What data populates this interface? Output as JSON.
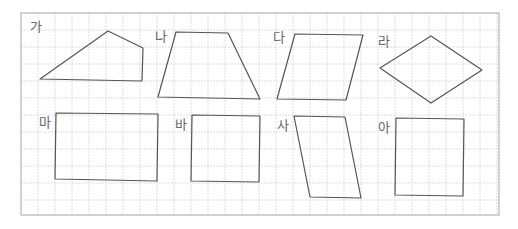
{
  "figure": {
    "grid": {
      "left": 21,
      "top": 13,
      "right": 499,
      "bottom": 215,
      "spacing": 17,
      "line_color": "#d4d4d4",
      "border_color": "#b5b5b5"
    },
    "stroke_color": "#555555",
    "shapes": [
      {
        "label": "가",
        "label_pos": [
          30,
          31
        ],
        "points": [
          [
            40,
            79
          ],
          [
            108,
            31
          ],
          [
            143,
            48
          ],
          [
            142,
            81
          ]
        ]
      },
      {
        "label": "나",
        "label_pos": [
          155,
          41
        ],
        "points": [
          [
            176,
            32
          ],
          [
            228,
            33
          ],
          [
            260,
            99
          ],
          [
            158,
            97
          ]
        ]
      },
      {
        "label": "다",
        "label_pos": [
          273,
          42
        ],
        "points": [
          [
            295,
            34
          ],
          [
            363,
            35
          ],
          [
            346,
            100
          ],
          [
            277,
            99
          ]
        ]
      },
      {
        "label": "라",
        "label_pos": [
          378,
          46
        ],
        "points": [
          [
            431,
            36
          ],
          [
            482,
            70
          ],
          [
            431,
            103
          ],
          [
            380,
            68
          ]
        ]
      },
      {
        "label": "마",
        "label_pos": [
          39,
          127
        ],
        "points": [
          [
            56,
            113
          ],
          [
            158,
            114
          ],
          [
            157,
            181
          ],
          [
            55,
            179
          ]
        ]
      },
      {
        "label": "바",
        "label_pos": [
          175,
          129
        ],
        "points": [
          [
            192,
            115
          ],
          [
            260,
            116
          ],
          [
            259,
            182
          ],
          [
            191,
            181
          ]
        ]
      },
      {
        "label": "사",
        "label_pos": [
          277,
          130
        ],
        "points": [
          [
            294,
            116
          ],
          [
            345,
            117
          ],
          [
            361,
            198
          ],
          [
            310,
            197
          ]
        ]
      },
      {
        "label": "아",
        "label_pos": [
          378,
          132
        ],
        "points": [
          [
            396,
            118
          ],
          [
            464,
            119
          ],
          [
            463,
            196
          ],
          [
            395,
            195
          ]
        ]
      }
    ]
  }
}
